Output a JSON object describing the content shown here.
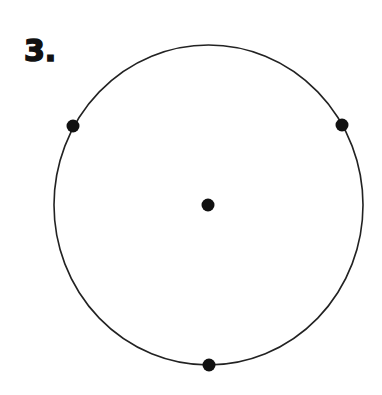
{
  "problem_label": "3.",
  "figure": {
    "stroke_color": "#222222",
    "dot_color": "#111111",
    "circle": {
      "cx": 208.5,
      "cy": 205,
      "rx": 154.5,
      "ry": 160
    },
    "points": [
      {
        "name": "center",
        "cx": 208,
        "cy": 205
      },
      {
        "name": "left",
        "cx": 73,
        "cy": 126
      },
      {
        "name": "right",
        "cx": 342,
        "cy": 125
      },
      {
        "name": "bottom",
        "cx": 209,
        "cy": 365
      }
    ]
  }
}
